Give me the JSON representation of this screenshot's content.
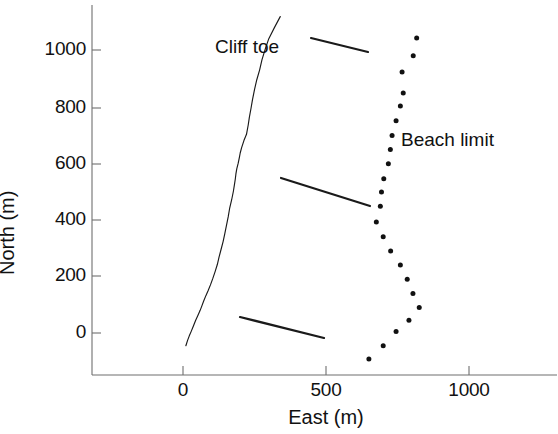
{
  "chart_data": {
    "type": "scatter",
    "title": "",
    "xlabel": "East (m)",
    "ylabel": "North (m)",
    "xlim": [
      -320,
      1110
    ],
    "ylim": [
      -180,
      1110
    ],
    "grid": false,
    "legend_position": "inline-annotations",
    "xticks": [
      0,
      500,
      1000
    ],
    "xtick_labels": [
      "0",
      "500",
      "1000"
    ],
    "yticks": [
      0,
      200,
      400,
      600,
      800,
      1000
    ],
    "ytick_labels": [
      "0",
      "200",
      "400",
      "600",
      "800",
      "1000"
    ],
    "series": [
      {
        "name": "Cliff toe",
        "style": "line",
        "x": [
          340,
          320,
          300,
          288,
          276,
          268,
          258,
          250,
          243,
          238,
          232,
          228,
          222,
          213,
          205,
          200,
          197,
          193,
          188,
          185,
          183,
          180,
          176,
          170,
          163,
          158,
          152,
          146,
          140,
          133,
          126,
          120,
          112,
          104,
          96,
          88,
          80,
          72,
          66,
          60,
          52,
          44,
          36,
          28,
          22,
          16,
          10
        ],
        "y": [
          1118,
          1080,
          1040,
          1005,
          965,
          930,
          895,
          860,
          825,
          795,
          762,
          735,
          702,
          680,
          655,
          636,
          620,
          600,
          580,
          562,
          545,
          525,
          500,
          470,
          440,
          410,
          380,
          350,
          322,
          295,
          268,
          242,
          216,
          192,
          170,
          150,
          132,
          112,
          96,
          80,
          62,
          44,
          24,
          4,
          -10,
          -26,
          -45
        ]
      },
      {
        "name": "Beach limit",
        "style": "dots",
        "x": [
          817,
          805,
          766,
          770,
          760,
          745,
          731,
          725,
          718,
          702,
          694,
          690,
          676,
          700,
          726,
          760,
          784,
          804,
          826,
          790,
          745,
          700,
          650
        ],
        "y": [
          1042,
          980,
          922,
          848,
          802,
          750,
          698,
          648,
          598,
          545,
          498,
          448,
          392,
          340,
          290,
          240,
          190,
          140,
          90,
          45,
          5,
          -45,
          -92
        ]
      }
    ],
    "annotations": [
      {
        "text": "Cliff toe",
        "label_x_px": 215,
        "label_y_px": 36,
        "leader_from_px": [
          311,
          38
        ],
        "leader_to_px": [
          368,
          52
        ]
      },
      {
        "text": "Beach limit",
        "label_x_px": 401,
        "label_y_px": 129,
        "leader_from_px": [
          281,
          178
        ],
        "leader_to_px": [
          370,
          206
        ]
      },
      {
        "text": "",
        "label_x_px": 0,
        "label_y_px": 0,
        "leader_from_px": [
          240,
          317
        ],
        "leader_to_px": [
          324,
          338
        ]
      }
    ]
  },
  "axes": {
    "x_title": "East (m)",
    "y_title": "North (m)",
    "y_title_visible_fragment": "rth (m)",
    "x_ticks": [
      {
        "label": "0",
        "px": 183
      },
      {
        "label": "500",
        "px": 326
      },
      {
        "label": "1000",
        "px": 469
      }
    ],
    "y_ticks": [
      {
        "label": "1000",
        "px": 50
      },
      {
        "label": "800",
        "px": 108
      },
      {
        "label": "600",
        "px": 164
      },
      {
        "label": "400",
        "px": 220
      },
      {
        "label": "200",
        "px": 276
      },
      {
        "label": "0",
        "px": 333
      }
    ]
  },
  "labels": {
    "cliff_toe": "Cliff toe",
    "beach_limit": "Beach limit"
  },
  "colors": {
    "ink": "#1a1a1a",
    "axis": "#6b6b6b",
    "background": "#ffffff",
    "marker": "#111111"
  }
}
